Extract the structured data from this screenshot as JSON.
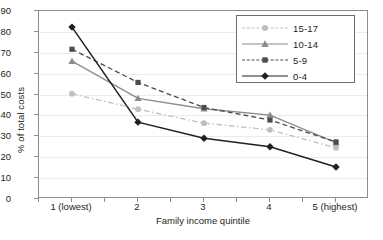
{
  "chart_data": {
    "type": "line",
    "title": "",
    "xlabel": "Family income quintile",
    "ylabel": "% of total costs",
    "categories": [
      "1 (lowest)",
      "2",
      "3",
      "4",
      "5 (highest)"
    ],
    "ylim": [
      0,
      90
    ],
    "yticks": [
      0,
      10,
      20,
      30,
      40,
      50,
      60,
      70,
      80,
      90
    ],
    "grid": true,
    "legend_position": "top-right",
    "series": [
      {
        "name": "15-17",
        "values": [
          50.4,
          43.0,
          36.3,
          33.1,
          24.5
        ],
        "color": "#bfbfbf",
        "marker": "circle",
        "linestyle": "dashdot"
      },
      {
        "name": "10-14",
        "values": [
          66.0,
          48.2,
          43.2,
          40.2,
          27.0
        ],
        "color": "#8c8c8c",
        "marker": "triangle",
        "linestyle": "solid"
      },
      {
        "name": "5-9",
        "values": [
          71.7,
          55.8,
          43.8,
          37.8,
          27.3
        ],
        "color": "#4d4d4d",
        "marker": "square",
        "linestyle": "dashed"
      },
      {
        "name": "0-4",
        "values": [
          82.3,
          36.8,
          29.1,
          25.0,
          15.3
        ],
        "color": "#231f20",
        "marker": "diamond",
        "linestyle": "solid"
      }
    ]
  },
  "colors": {
    "axis": "#8c8c8c",
    "grid": "#ececec",
    "text": "#231f20",
    "legend_border": "#6d6d6d",
    "background": "#ffffff"
  }
}
